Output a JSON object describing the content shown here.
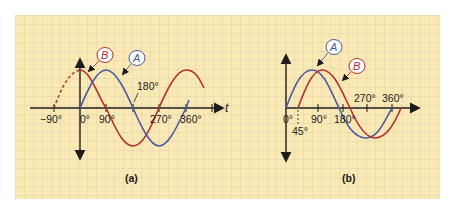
{
  "colors": {
    "paper": "#fbe9b4",
    "grid_minor": "#c9c2ae",
    "grid_major": "#b7b2a4",
    "axis": "#1c1c1c",
    "wave_a": "#4a5aa6",
    "wave_b": "#b8302e",
    "label_a_stroke": "#4a5aa6",
    "label_b_stroke": "#b8302e"
  },
  "panel_a": {
    "caption": "(a)",
    "time_axis_label": "t",
    "tick_labels": {
      "neg90": "−90°",
      "0": "0°",
      "90": "90°",
      "180": "180°",
      "270": "270°",
      "360": "360°"
    },
    "wave_a_label": "A",
    "wave_b_label": "B"
  },
  "panel_b": {
    "caption": "(b)",
    "tick_labels": {
      "0": "0°",
      "45": "45°",
      "90": "90°",
      "180": "180°",
      "270": "270°",
      "360": "360°"
    },
    "wave_a_label": "A",
    "wave_b_label": "B"
  }
}
